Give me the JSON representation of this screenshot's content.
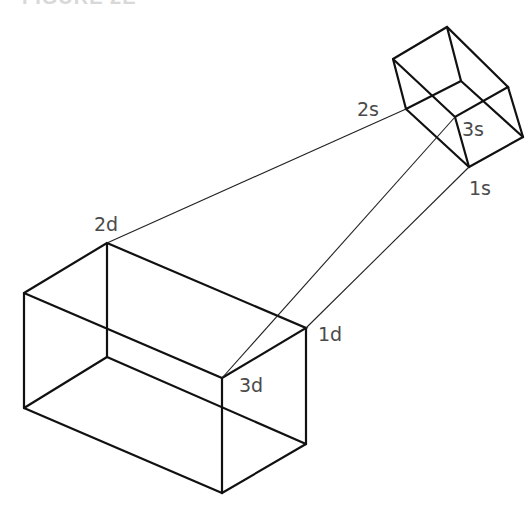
{
  "caption": "FIGURE 2E",
  "labels": {
    "d1": "1d",
    "d2": "2d",
    "d3": "3d",
    "s1": "1s",
    "s2": "2s",
    "s3": "3s"
  },
  "small_box": {
    "vertices": {
      "top": [
        447,
        27
      ],
      "left": [
        393,
        59
      ],
      "back_inner": [
        461,
        81
      ],
      "right_upper": [
        508,
        87
      ],
      "left_mid_2s": [
        406,
        109
      ],
      "front_center_3s": [
        455,
        117
      ],
      "right_lower": [
        523,
        137
      ],
      "bottom_1s": [
        469,
        167
      ]
    }
  },
  "large_box": {
    "vertices": {
      "top_back_2d": [
        107,
        243
      ],
      "left_top": [
        24,
        293
      ],
      "back_bottom": [
        107,
        357
      ],
      "left_bottom": [
        24,
        408
      ],
      "right_top_1d": [
        306,
        328
      ],
      "front_top_3d": [
        222,
        378
      ],
      "right_bottom": [
        306,
        444
      ],
      "front_bottom": [
        222,
        493
      ]
    }
  },
  "projection_lines": [
    {
      "from": "2s",
      "to": "2d"
    },
    {
      "from": "3s",
      "to": "3d"
    },
    {
      "from": "1s",
      "to": "1d"
    }
  ]
}
